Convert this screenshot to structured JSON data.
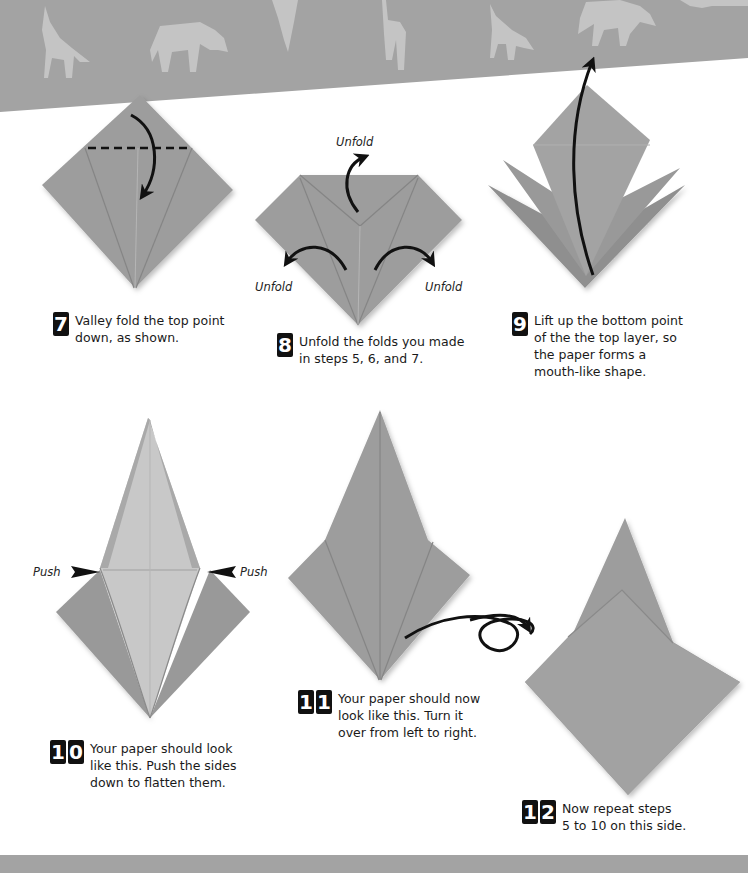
{
  "colors": {
    "paper": "#9b9b9b",
    "paper_dark": "#8c8c8c",
    "paper_light": "#c9c9c9",
    "banner": "#a3a3a3",
    "banner_animals": "#c4c4c4",
    "arrow": "#111111"
  },
  "banner": {
    "animals": [
      "wolf",
      "rhino",
      "bird",
      "giraffe",
      "wolf",
      "rhino",
      "rhino"
    ]
  },
  "steps": [
    {
      "number": "7",
      "text": "Valley fold the top point\ndown, as shown."
    },
    {
      "number": "8",
      "text": "Unfold the folds you made\nin steps 5, 6, and 7."
    },
    {
      "number": "9",
      "text": "Lift up the bottom point\nof the the top layer, so\nthe paper forms a\nmouth-like shape."
    },
    {
      "number": "10",
      "text": "Your paper should look\nlike this. Push the sides\ndown to flatten them."
    },
    {
      "number": "11",
      "text": "Your paper should now\nlook like this. Turn it\nover from left to right."
    },
    {
      "number": "12",
      "text": "Now repeat steps\n5 to 10 on this side."
    }
  ],
  "labels": {
    "unfold_top": "Unfold",
    "unfold_left": "Unfold",
    "unfold_right": "Unfold",
    "push_left": "Push",
    "push_right": "Push"
  }
}
